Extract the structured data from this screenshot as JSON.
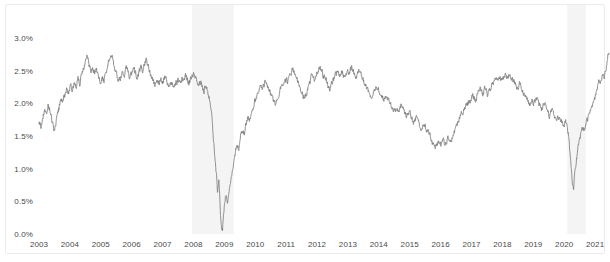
{
  "chart_data": {
    "type": "line",
    "title": "",
    "subtitle": "",
    "xlabel": "",
    "ylabel": "",
    "grid": false,
    "legend": "none",
    "line_color": "#808080",
    "background_color": "#ffffff",
    "shading_color": "#f4f4f5",
    "ylim": [
      0.0,
      3.0
    ],
    "yticks": [
      0.0,
      0.5,
      1.0,
      1.5,
      2.0,
      2.5,
      3.0
    ],
    "ytick_labels": [
      "0.0%",
      "0.5%",
      "1.0%",
      "1.5%",
      "2.0%",
      "2.5%",
      "3.0%"
    ],
    "xlim": [
      2003.0,
      2021.45
    ],
    "xticks": [
      2003,
      2004,
      2005,
      2006,
      2007,
      2008,
      2009,
      2010,
      2011,
      2012,
      2013,
      2014,
      2015,
      2016,
      2017,
      2018,
      2019,
      2020,
      2021
    ],
    "xtick_labels": [
      "2003",
      "2004",
      "2005",
      "2006",
      "2007",
      "2008",
      "2009",
      "2010",
      "2011",
      "2012",
      "2013",
      "2014",
      "2015",
      "2016",
      "2017",
      "2018",
      "2019",
      "2020",
      "2021"
    ],
    "shaded_regions": [
      {
        "label": "recession-2008",
        "start": 2007.95,
        "end": 2009.3
      },
      {
        "label": "recession-2020",
        "start": 2020.1,
        "end": 2020.7
      }
    ],
    "series": [
      {
        "name": "yield",
        "units": "percent",
        "x": [
          2003.0,
          2003.06,
          2003.12,
          2003.18,
          2003.24,
          2003.3,
          2003.36,
          2003.42,
          2003.48,
          2003.54,
          2003.6,
          2003.66,
          2003.72,
          2003.78,
          2003.84,
          2003.9,
          2003.96,
          2004.02,
          2004.08,
          2004.14,
          2004.2,
          2004.26,
          2004.32,
          2004.38,
          2004.44,
          2004.5,
          2004.56,
          2004.62,
          2004.68,
          2004.74,
          2004.8,
          2004.86,
          2004.92,
          2004.98,
          2005.04,
          2005.1,
          2005.16,
          2005.22,
          2005.28,
          2005.34,
          2005.4,
          2005.46,
          2005.52,
          2005.58,
          2005.64,
          2005.7,
          2005.76,
          2005.82,
          2005.88,
          2005.94,
          2006.0,
          2006.06,
          2006.12,
          2006.18,
          2006.24,
          2006.3,
          2006.36,
          2006.42,
          2006.48,
          2006.54,
          2006.6,
          2006.66,
          2006.72,
          2006.78,
          2006.84,
          2006.9,
          2006.96,
          2007.02,
          2007.08,
          2007.14,
          2007.2,
          2007.26,
          2007.32,
          2007.38,
          2007.44,
          2007.5,
          2007.56,
          2007.62,
          2007.68,
          2007.74,
          2007.8,
          2007.86,
          2007.92,
          2007.98,
          2008.04,
          2008.1,
          2008.16,
          2008.22,
          2008.28,
          2008.34,
          2008.4,
          2008.46,
          2008.52,
          2008.58,
          2008.62,
          2008.66,
          2008.7,
          2008.74,
          2008.78,
          2008.82,
          2008.86,
          2008.9,
          2008.94,
          2008.98,
          2009.04,
          2009.1,
          2009.16,
          2009.22,
          2009.28,
          2009.34,
          2009.4,
          2009.46,
          2009.52,
          2009.58,
          2009.64,
          2009.7,
          2009.76,
          2009.82,
          2009.88,
          2009.94,
          2010.0,
          2010.08,
          2010.16,
          2010.24,
          2010.32,
          2010.4,
          2010.48,
          2010.56,
          2010.64,
          2010.72,
          2010.8,
          2010.88,
          2010.96,
          2011.04,
          2011.12,
          2011.2,
          2011.28,
          2011.36,
          2011.44,
          2011.52,
          2011.6,
          2011.68,
          2011.76,
          2011.84,
          2011.92,
          2012.0,
          2012.08,
          2012.16,
          2012.24,
          2012.32,
          2012.4,
          2012.48,
          2012.56,
          2012.64,
          2012.72,
          2012.8,
          2012.88,
          2012.96,
          2013.04,
          2013.12,
          2013.2,
          2013.28,
          2013.36,
          2013.44,
          2013.52,
          2013.6,
          2013.68,
          2013.76,
          2013.84,
          2013.92,
          2014.0,
          2014.08,
          2014.16,
          2014.24,
          2014.32,
          2014.4,
          2014.48,
          2014.56,
          2014.64,
          2014.72,
          2014.8,
          2014.88,
          2014.96,
          2015.04,
          2015.12,
          2015.2,
          2015.28,
          2015.36,
          2015.44,
          2015.52,
          2015.6,
          2015.68,
          2015.76,
          2015.84,
          2015.92,
          2016.0,
          2016.08,
          2016.16,
          2016.24,
          2016.32,
          2016.4,
          2016.48,
          2016.56,
          2016.64,
          2016.72,
          2016.8,
          2016.88,
          2016.96,
          2017.04,
          2017.12,
          2017.2,
          2017.28,
          2017.36,
          2017.44,
          2017.52,
          2017.6,
          2017.68,
          2017.76,
          2017.84,
          2017.92,
          2018.0,
          2018.08,
          2018.16,
          2018.24,
          2018.32,
          2018.4,
          2018.48,
          2018.56,
          2018.64,
          2018.72,
          2018.8,
          2018.88,
          2018.96,
          2019.04,
          2019.12,
          2019.2,
          2019.28,
          2019.36,
          2019.44,
          2019.52,
          2019.6,
          2019.68,
          2019.76,
          2019.84,
          2019.92,
          2019.98,
          2020.04,
          2020.1,
          2020.14,
          2020.18,
          2020.22,
          2020.26,
          2020.3,
          2020.34,
          2020.4,
          2020.46,
          2020.52,
          2020.58,
          2020.64,
          2020.7,
          2020.76,
          2020.82,
          2020.88,
          2020.94,
          2021.0,
          2021.06,
          2021.12,
          2021.18,
          2021.24,
          2021.3,
          2021.36,
          2021.42
        ],
        "y": [
          1.7,
          1.63,
          1.78,
          1.93,
          1.85,
          1.97,
          1.88,
          1.72,
          1.58,
          1.66,
          1.82,
          1.95,
          2.06,
          2.02,
          2.12,
          2.22,
          2.16,
          2.27,
          2.2,
          2.32,
          2.25,
          2.38,
          2.3,
          2.44,
          2.52,
          2.63,
          2.72,
          2.6,
          2.5,
          2.57,
          2.45,
          2.52,
          2.4,
          2.33,
          2.42,
          2.35,
          2.48,
          2.55,
          2.68,
          2.75,
          2.62,
          2.52,
          2.42,
          2.33,
          2.4,
          2.5,
          2.43,
          2.55,
          2.47,
          2.38,
          2.46,
          2.55,
          2.48,
          2.4,
          2.5,
          2.58,
          2.5,
          2.6,
          2.68,
          2.58,
          2.48,
          2.38,
          2.31,
          2.28,
          2.34,
          2.3,
          2.36,
          2.32,
          2.4,
          2.33,
          2.28,
          2.35,
          2.29,
          2.24,
          2.3,
          2.36,
          2.3,
          2.38,
          2.33,
          2.42,
          2.36,
          2.3,
          2.38,
          2.45,
          2.42,
          2.33,
          2.26,
          2.33,
          2.27,
          2.2,
          2.26,
          2.18,
          2.05,
          1.85,
          1.62,
          1.38,
          1.15,
          0.95,
          0.62,
          0.85,
          0.42,
          0.12,
          0.05,
          0.35,
          0.62,
          0.48,
          0.68,
          0.85,
          1.02,
          1.2,
          1.38,
          1.28,
          1.45,
          1.6,
          1.52,
          1.68,
          1.8,
          1.72,
          1.85,
          1.95,
          2.05,
          2.18,
          2.3,
          2.22,
          2.35,
          2.28,
          2.18,
          2.08,
          1.98,
          2.08,
          2.2,
          2.3,
          2.4,
          2.32,
          2.42,
          2.52,
          2.45,
          2.35,
          2.25,
          2.15,
          2.05,
          2.18,
          2.3,
          2.42,
          2.35,
          2.45,
          2.55,
          2.48,
          2.4,
          2.32,
          2.22,
          2.3,
          2.4,
          2.48,
          2.4,
          2.5,
          2.42,
          2.5,
          2.48,
          2.56,
          2.48,
          2.4,
          2.48,
          2.4,
          2.32,
          2.25,
          2.18,
          2.12,
          2.2,
          2.28,
          2.2,
          2.12,
          2.05,
          2.12,
          2.05,
          1.98,
          1.92,
          1.85,
          1.9,
          1.98,
          1.9,
          1.82,
          1.88,
          1.8,
          1.72,
          1.78,
          1.7,
          1.62,
          1.7,
          1.62,
          1.55,
          1.48,
          1.38,
          1.3,
          1.42,
          1.35,
          1.45,
          1.38,
          1.48,
          1.4,
          1.5,
          1.6,
          1.7,
          1.8,
          1.88,
          1.95,
          2.0,
          2.05,
          2.12,
          2.05,
          2.15,
          2.22,
          2.15,
          2.22,
          2.15,
          2.22,
          2.3,
          2.38,
          2.32,
          2.4,
          2.35,
          2.45,
          2.38,
          2.45,
          2.38,
          2.3,
          2.22,
          2.3,
          2.22,
          2.14,
          2.06,
          1.98,
          2.05,
          2.0,
          2.08,
          2.0,
          1.92,
          1.98,
          1.9,
          1.82,
          1.9,
          1.82,
          1.74,
          1.8,
          1.72,
          1.65,
          1.72,
          1.65,
          1.5,
          1.28,
          1.05,
          0.82,
          0.65,
          0.95,
          1.15,
          1.35,
          1.5,
          1.62,
          1.58,
          1.68,
          1.75,
          1.82,
          1.9,
          1.98,
          2.1,
          2.22,
          2.35,
          2.3,
          2.42,
          2.38,
          2.55,
          2.78
        ]
      }
    ]
  }
}
